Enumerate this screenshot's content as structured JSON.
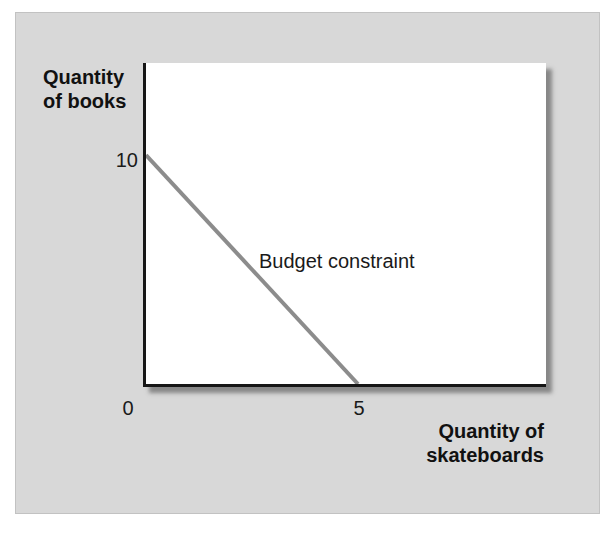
{
  "figure": {
    "panel_color": "#d8d8d8",
    "plot_background": "#ffffff",
    "axis_color": "#161616",
    "text_color": "#1a1a1a"
  },
  "chart_data": {
    "type": "line",
    "title": "",
    "xlabel": "Quantity of skateboards",
    "ylabel": "Quantity of books",
    "xlabel_lines": [
      "Quantity of",
      "skateboards"
    ],
    "ylabel_lines": [
      "Quantity",
      "of books"
    ],
    "xlim": [
      0,
      9.5
    ],
    "ylim": [
      0,
      14
    ],
    "grid": false,
    "legend_position": "none",
    "x_ticks": [
      {
        "value": 0,
        "label": "0"
      },
      {
        "value": 5,
        "label": "5"
      }
    ],
    "y_ticks": [
      {
        "value": 10,
        "label": "10"
      }
    ],
    "series": [
      {
        "name": "Budget constraint",
        "color": "#8c8c8c",
        "stroke_width": 4,
        "points": [
          {
            "x": 0,
            "y": 10
          },
          {
            "x": 5,
            "y": 0
          }
        ]
      }
    ],
    "annotations": [
      {
        "text": "Budget constraint",
        "x": 2.7,
        "y": 5.3
      }
    ]
  }
}
